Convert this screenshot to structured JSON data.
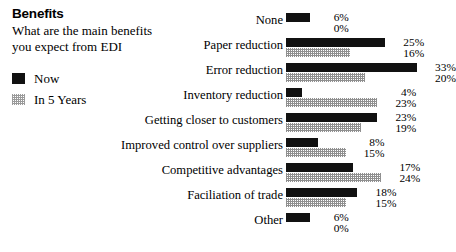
{
  "header": {
    "title": "Benefits",
    "subtitle": "What are the main benefits you expect from EDI"
  },
  "legend": {
    "items": [
      {
        "label": "Now",
        "swatch": "solid-black-swatch",
        "color": "#111111"
      },
      {
        "label": "In 5 Years",
        "swatch": "dotted-gray-swatch",
        "color": "#9a9a9a"
      }
    ]
  },
  "chart_data": {
    "type": "bar",
    "title": "Benefits",
    "subtitle": "What are the main benefits you expect from EDI",
    "orientation": "horizontal",
    "xlabel": "",
    "ylabel": "",
    "xlim": [
      0,
      35
    ],
    "grid": false,
    "legend_position": "left",
    "value_suffix": "%",
    "categories": [
      "None",
      "Paper reduction",
      "Error reduction",
      "Inventory reduction",
      "Getting closer to customers",
      "Improved control over suppliers",
      "Competitive advantages",
      "Faciliation of trade",
      "Other"
    ],
    "series": [
      {
        "name": "Now",
        "values": [
          6,
          25,
          33,
          4,
          23,
          8,
          17,
          18,
          6
        ],
        "labels": [
          "6%",
          "25%",
          "33%",
          "4%",
          "23%",
          "8%",
          "17%",
          "18%",
          "6%"
        ]
      },
      {
        "name": "In 5 Years",
        "values": [
          0,
          16,
          20,
          23,
          19,
          15,
          24,
          15,
          0
        ],
        "labels": [
          "0%",
          "16%",
          "20%",
          "23%",
          "19%",
          "15%",
          "24%",
          "15%",
          "0%"
        ]
      }
    ]
  }
}
